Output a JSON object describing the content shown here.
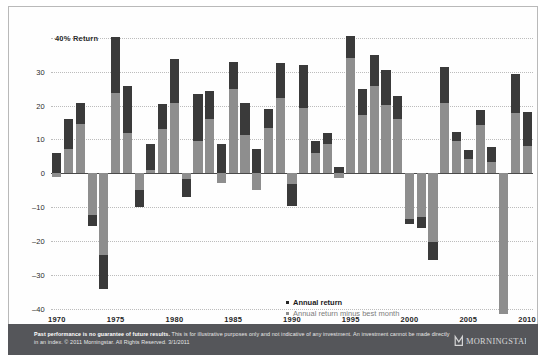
{
  "chart_data": {
    "type": "bar",
    "title": "",
    "subtitle": "",
    "xlabel": "",
    "ylabel": "40% Return",
    "ylim": [
      -40,
      42
    ],
    "yticks": [
      40,
      30,
      20,
      10,
      0,
      -10,
      -20,
      -30,
      -40
    ],
    "ytick_labels": [
      "40% Return",
      "30",
      "20",
      "10",
      "0",
      "–10",
      "–20",
      "–30",
      "–40"
    ],
    "xticks": [
      1970,
      1975,
      1980,
      1985,
      1990,
      1995,
      2000,
      2005,
      2010
    ],
    "xtick_labels": [
      "1970",
      "1975",
      "1980",
      "1985",
      "1990",
      "1995",
      "2000",
      "2005",
      "2010"
    ],
    "grid": true,
    "legend_position": "inside-lower-center",
    "series": [
      {
        "name": "Annual return",
        "color": "#3a3a3a",
        "values": [
          6.0,
          16.0,
          20.9,
          -15.4,
          -34.2,
          40.3,
          25.9,
          -9.9,
          8.7,
          20.6,
          33.6,
          -6.9,
          23.4,
          24.3,
          8.6,
          32.8,
          20.8,
          7.2,
          19.1,
          32.7,
          -9.5,
          32.1,
          9.7,
          11.9,
          2.0,
          40.6,
          25.0,
          35.0,
          30.6,
          22.8,
          -15.0,
          -16.0,
          -25.6,
          31.3,
          12.2,
          6.9,
          18.6,
          7.9,
          -38.4,
          29.3,
          18.0
        ]
      },
      {
        "name": "Annual return minus best month",
        "color": "#8e8e8e",
        "values": [
          -1.2,
          7.2,
          14.5,
          -12.2,
          -24.0,
          23.8,
          11.8,
          -5.0,
          0.9,
          13.0,
          20.8,
          -1.6,
          9.7,
          16.0,
          -2.7,
          24.8,
          11.4,
          -4.8,
          13.4,
          22.3,
          -3.1,
          19.3,
          6.1,
          8.6,
          -1.3,
          33.9,
          17.2,
          25.8,
          20.3,
          16.1,
          -13.6,
          -13.0,
          -20.3,
          20.8,
          9.6,
          4.3,
          14.2,
          3.5,
          -41.5,
          17.8,
          8.1
        ]
      }
    ],
    "x": [
      1970,
      1971,
      1972,
      1973,
      1974,
      1975,
      1976,
      1977,
      1978,
      1979,
      1980,
      1981,
      1982,
      1983,
      1984,
      1985,
      1986,
      1987,
      1988,
      1989,
      1990,
      1991,
      1992,
      1993,
      1994,
      1995,
      1996,
      1997,
      1998,
      1999,
      2000,
      2001,
      2002,
      2003,
      2004,
      2005,
      2006,
      2007,
      2008,
      2009,
      2010
    ],
    "legend": [
      {
        "label": "Annual return",
        "color": "#3a3a3a"
      },
      {
        "label": "Annual return minus best month",
        "color": "#8e8e8e"
      }
    ]
  },
  "footer": {
    "bold_lead": "Past performance is no guarantee of future results.",
    "body": " This is for illustrative purposes only and not indicative of any investment. An investment cannot be made directly in an index. © 2011 Morningstar. All Rights Reserved. 3/1/2011",
    "logo_text": "MORNINGSTAR",
    "background": "#55565a"
  },
  "colors": {
    "annual_return": "#3a3a3a",
    "minus_best_month": "#8e8e8e",
    "grid": "#bcbcbc",
    "axis": "#4a4a4a",
    "plot_background": "#fefefe"
  }
}
